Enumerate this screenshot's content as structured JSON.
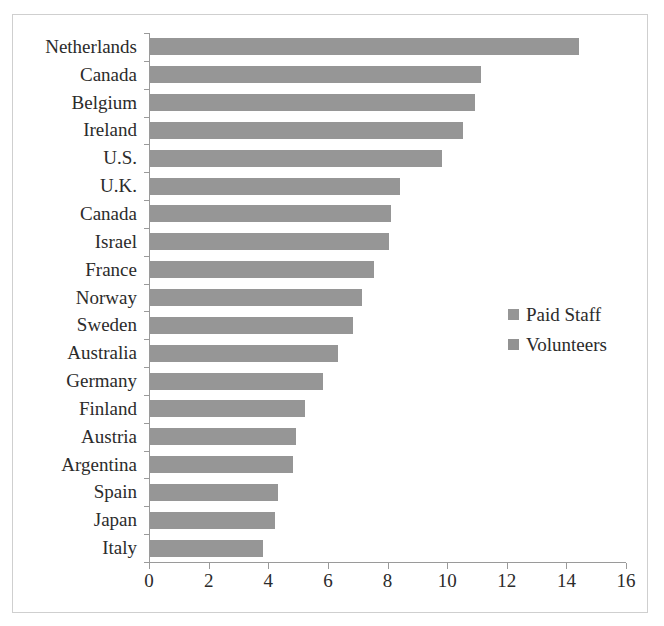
{
  "chart_data": {
    "type": "bar",
    "orientation": "horizontal",
    "title": "",
    "subtitle": "",
    "xlabel": "",
    "ylabel": "",
    "xlim": [
      0,
      16
    ],
    "xticks": [
      0,
      2,
      4,
      6,
      8,
      10,
      12,
      14,
      16
    ],
    "xtick_labels": [
      "0",
      "2",
      "4",
      "6",
      "8",
      "10",
      "12",
      "14",
      "16"
    ],
    "grid": false,
    "legend_position": "middle-right",
    "categories": [
      "Netherlands",
      "Canada",
      "Belgium",
      "Ireland",
      "U.S.",
      "U.K.",
      "Canada",
      "Israel",
      "France",
      "Norway",
      "Sweden",
      "Australia",
      "Germany",
      "Finland",
      "Austria",
      "Argentina",
      "Spain",
      "Japan",
      "Italy"
    ],
    "series": [
      {
        "name": "Paid Staff",
        "color": "#969696",
        "values": [
          14.4,
          11.1,
          10.9,
          10.5,
          9.8,
          8.4,
          8.1,
          8.0,
          7.5,
          7.1,
          6.8,
          6.3,
          5.8,
          5.2,
          4.9,
          4.8,
          4.3,
          4.2,
          3.8
        ]
      }
    ],
    "legend": [
      {
        "label": "Paid Staff",
        "color": "#969696"
      },
      {
        "label": "Volunteers",
        "color": "#929292"
      }
    ],
    "values": [
      14.4,
      11.1,
      10.9,
      10.5,
      9.8,
      8.4,
      8.1,
      8.0,
      7.5,
      7.1,
      6.8,
      6.3,
      5.8,
      5.2,
      4.9,
      4.8,
      4.3,
      4.2,
      3.8
    ]
  },
  "colors": {
    "bar": "#969696",
    "axis": "#9a9a9a",
    "frame_border": "#cfcfcf",
    "text": "#2b2b2b",
    "background": "#ffffff"
  }
}
